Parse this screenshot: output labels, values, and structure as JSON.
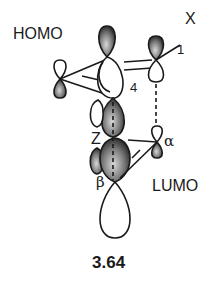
{
  "diagram": {
    "labels": {
      "homo": "HOMO",
      "lumo": "LUMO",
      "substituent": "X",
      "atom_1": "1",
      "atom_4": "4",
      "z_group": "Z",
      "alpha": "α",
      "beta": "β"
    },
    "caption": "3.64",
    "colors": {
      "stroke": "#1a1a1a",
      "shaded_lobe_dark": "#2a2a2a",
      "shaded_lobe_light": "#bdbdbd",
      "unshaded_lobe": "#ffffff"
    }
  }
}
